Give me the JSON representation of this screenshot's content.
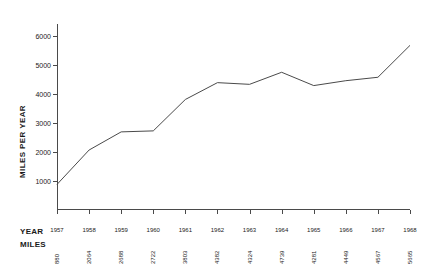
{
  "chart_data": {
    "type": "line",
    "title": "",
    "xlabel": "YEAR",
    "ylabel": "MILES PER YEAR",
    "categories": [
      "1957",
      "1958",
      "1959",
      "1960",
      "1961",
      "1962",
      "1963",
      "1964",
      "1965",
      "1966",
      "1967",
      "1968"
    ],
    "values": [
      880,
      2064,
      2688,
      2722,
      3803,
      4382,
      4324,
      4739,
      4281,
      4449,
      4567,
      5665
    ],
    "ylim": [
      0,
      6400
    ],
    "yticks": [
      1000,
      2000,
      3000,
      4000,
      5000,
      6000
    ],
    "ytick_labels": [
      "1000",
      "2000",
      "3000",
      "4000",
      "5000",
      "6000"
    ],
    "grid": false,
    "legend": false,
    "line_color": "#4a4a4a"
  },
  "table": {
    "year_row_label": "YEAR",
    "miles_row_label": "MILES"
  }
}
